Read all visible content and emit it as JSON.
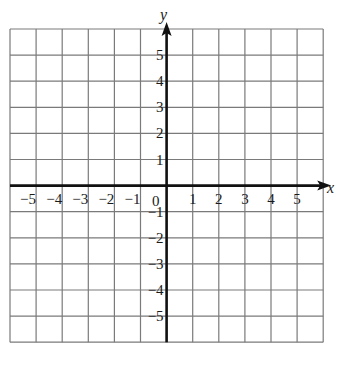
{
  "chart_data": {
    "type": "scatter",
    "title": "",
    "xlabel": "x",
    "ylabel": "y",
    "xlim": [
      -6,
      6
    ],
    "ylim": [
      -6,
      6
    ],
    "grid": true,
    "x_ticks": [
      "-5",
      "-4",
      "-3",
      "-2",
      "-1",
      "0",
      "1",
      "2",
      "3",
      "4",
      "5"
    ],
    "y_ticks": [
      "5",
      "4",
      "3",
      "2",
      "1",
      "-1",
      "-2",
      "-3",
      "-4",
      "-5"
    ],
    "series": []
  },
  "labels": {
    "x_axis": "x",
    "y_axis": "y",
    "origin": "0",
    "x_tick_values": [
      -5,
      -4,
      -3,
      -2,
      -1,
      1,
      2,
      3,
      4,
      5
    ],
    "x_tick_text": [
      "−5",
      "−4",
      "−3",
      "−2",
      "−1",
      "1",
      "2",
      "3",
      "4",
      "5"
    ],
    "y_tick_values": [
      5,
      4,
      3,
      2,
      1,
      -1,
      -2,
      -3,
      -4,
      -5
    ],
    "y_tick_text": [
      "5",
      "4",
      "3",
      "2",
      "1",
      "−1",
      "−2",
      "−3",
      "−4",
      "−5"
    ]
  },
  "colors": {
    "grid": "#7a7a7a",
    "axis": "#111111",
    "text": "#1a1a1a"
  }
}
